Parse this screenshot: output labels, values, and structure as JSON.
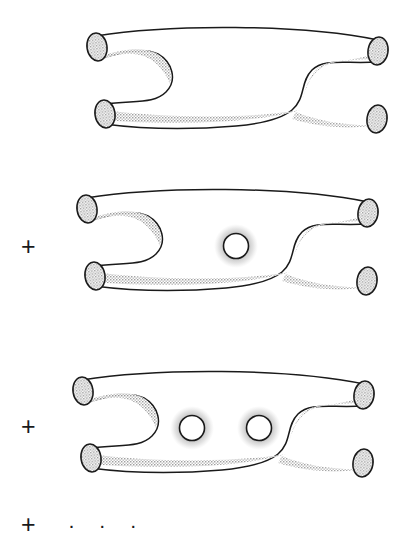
{
  "figure": {
    "background_color": "#ffffff",
    "outline_color": "#1a1a1a",
    "shading_color": "#b9b9b9",
    "tube_fill_color": "#ffffff",
    "cap_fill_color": "#d8d8d8"
  },
  "terms": [
    {
      "name": "genus-0-term",
      "label": "",
      "operator": "",
      "handles": 0,
      "holes": []
    },
    {
      "name": "genus-1-term",
      "label": "",
      "operator": "+",
      "handles": 1,
      "holes": [
        {
          "cx": 236,
          "cy": 246,
          "r": 13
        }
      ]
    },
    {
      "name": "genus-2-term",
      "label": "",
      "operator": "+",
      "handles": 2,
      "holes": [
        {
          "cx": 192,
          "cy": 428,
          "r": 13
        },
        {
          "cx": 259,
          "cy": 428,
          "r": 13
        }
      ]
    },
    {
      "name": "continuation-term",
      "label": "",
      "operator": "+",
      "handles": null,
      "holes": []
    }
  ],
  "operators": {
    "plus_1": "+",
    "plus_2": "+",
    "plus_3": "+"
  },
  "continuation": {
    "dots": "·  ·  ·"
  }
}
